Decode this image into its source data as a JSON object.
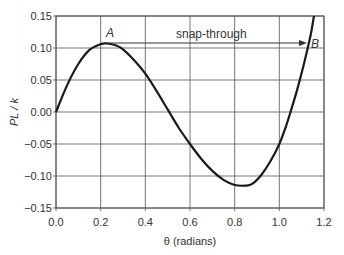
{
  "chart_data": {
    "type": "line",
    "title": "",
    "xlabel": "θ (radians)",
    "ylabel": "PL / k",
    "xlim": [
      0.0,
      1.2
    ],
    "ylim": [
      -0.15,
      0.15
    ],
    "grid": true,
    "legend": null,
    "x_ticks": [
      "0.0",
      "0.2",
      "0.4",
      "0.6",
      "0.8",
      "1.0",
      "1.2"
    ],
    "y_ticks": [
      "0.15",
      "0.10",
      "0.05",
      "0.00",
      "-0.05",
      "-0.10",
      "-0.15"
    ],
    "series": [
      {
        "name": "PL/k vs θ",
        "x": [
          0.0,
          0.05,
          0.1,
          0.15,
          0.2,
          0.23,
          0.27,
          0.3,
          0.35,
          0.4,
          0.45,
          0.5,
          0.55,
          0.6,
          0.65,
          0.7,
          0.75,
          0.8,
          0.85,
          0.88,
          0.92,
          0.96,
          1.0,
          1.03,
          1.05,
          1.08,
          1.11,
          1.14,
          1.155
        ],
        "y": [
          0.0,
          0.042,
          0.075,
          0.097,
          0.106,
          0.107,
          0.104,
          0.098,
          0.081,
          0.06,
          0.033,
          0.004,
          -0.025,
          -0.05,
          -0.073,
          -0.092,
          -0.106,
          -0.114,
          -0.115,
          -0.112,
          -0.098,
          -0.077,
          -0.05,
          -0.022,
          0.0,
          0.035,
          0.075,
          0.12,
          0.15
        ]
      }
    ],
    "annotations": [
      {
        "text": "A",
        "x": 0.23,
        "y": 0.107,
        "note": "local maximum"
      },
      {
        "text": "B",
        "x": 1.13,
        "y": 0.1
      },
      {
        "text": "snap-through",
        "type": "arrow",
        "from": [
          0.27,
          0.107
        ],
        "to": [
          1.11,
          0.107
        ]
      }
    ]
  },
  "labels": {
    "xlabel": "θ (radians)",
    "ylabel": "PL / k",
    "point_a": "A",
    "point_b": "B",
    "snap": "snap-through"
  },
  "colors": {
    "curve": "#1a1a1a",
    "grid": "#555555",
    "text": "#333333"
  }
}
